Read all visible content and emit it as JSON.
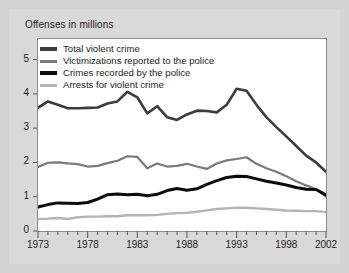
{
  "chart_data": {
    "type": "line",
    "title": "Offenses in millions",
    "xlabel": "",
    "ylabel": "Offenses in millions",
    "xlim": [
      1973,
      2002
    ],
    "ylim": [
      0,
      5.6
    ],
    "grid": false,
    "legend_position": "top-left",
    "y_ticks": [
      "0",
      "1",
      "2",
      "3",
      "4",
      "5"
    ],
    "y_tick_values": [
      0,
      1,
      2,
      3,
      4,
      5
    ],
    "x_ticks": [
      "1973",
      "1978",
      "1983",
      "1988",
      "1993",
      "1998",
      "2002"
    ],
    "x_tick_values": [
      1973,
      1978,
      1983,
      1988,
      1993,
      1998,
      2002
    ],
    "x": [
      1973,
      1974,
      1975,
      1976,
      1977,
      1978,
      1979,
      1980,
      1981,
      1982,
      1983,
      1984,
      1985,
      1986,
      1987,
      1988,
      1989,
      1990,
      1991,
      1992,
      1993,
      1994,
      1995,
      1996,
      1997,
      1998,
      1999,
      2000,
      2001,
      2002
    ],
    "series": [
      {
        "name": "Total violent crime",
        "color": "#3c3c3c",
        "width": 2.6,
        "values": [
          3.59,
          3.78,
          3.68,
          3.58,
          3.58,
          3.59,
          3.6,
          3.72,
          3.78,
          4.06,
          3.9,
          3.43,
          3.64,
          3.32,
          3.24,
          3.4,
          3.51,
          3.5,
          3.46,
          3.68,
          4.15,
          4.09,
          3.68,
          3.32,
          3.03,
          2.76,
          2.48,
          2.2,
          2.0,
          1.73
        ]
      },
      {
        "name": "Victimizations reported to the police",
        "color": "#7a7a7a",
        "width": 2.2,
        "values": [
          1.87,
          1.99,
          2.0,
          1.97,
          1.95,
          1.88,
          1.9,
          1.98,
          2.05,
          2.18,
          2.16,
          1.83,
          1.97,
          1.88,
          1.9,
          1.96,
          1.88,
          1.81,
          1.97,
          2.06,
          2.1,
          2.15,
          1.96,
          1.83,
          1.73,
          1.6,
          1.45,
          1.33,
          1.22,
          1.0
        ]
      },
      {
        "name": "Crimes recorded by the police",
        "color": "#0b0b0b",
        "width": 3.0,
        "values": [
          0.7,
          0.77,
          0.82,
          0.81,
          0.8,
          0.83,
          0.93,
          1.06,
          1.08,
          1.06,
          1.07,
          1.03,
          1.07,
          1.18,
          1.24,
          1.19,
          1.23,
          1.36,
          1.47,
          1.56,
          1.6,
          1.59,
          1.52,
          1.45,
          1.4,
          1.34,
          1.27,
          1.22,
          1.21,
          1.05
        ]
      },
      {
        "name": "Arrests for violent crime",
        "color": "#b4b4b4",
        "width": 2.4,
        "values": [
          0.35,
          0.36,
          0.38,
          0.35,
          0.4,
          0.42,
          0.42,
          0.43,
          0.43,
          0.46,
          0.46,
          0.46,
          0.47,
          0.5,
          0.52,
          0.53,
          0.56,
          0.6,
          0.64,
          0.66,
          0.68,
          0.68,
          0.66,
          0.64,
          0.62,
          0.6,
          0.59,
          0.58,
          0.58,
          0.55
        ]
      }
    ]
  },
  "legend": {
    "items": [
      {
        "label": "Total violent crime",
        "color": "#3c3c3c",
        "thickness": 4
      },
      {
        "label": "Victimizations reported to the police",
        "color": "#7a7a7a",
        "thickness": 3
      },
      {
        "label": "Crimes recorded by the police",
        "color": "#0b0b0b",
        "thickness": 4
      },
      {
        "label": "Arrests for violent crime",
        "color": "#b4b4b4",
        "thickness": 3
      }
    ]
  },
  "colors": {
    "figure_background": "#d4d4d4",
    "panel_background": "#d9d9d9",
    "plot_background": "#ffffff",
    "axis": "#555555",
    "text": "#1d1d1d"
  }
}
